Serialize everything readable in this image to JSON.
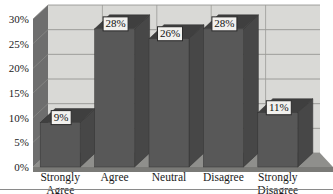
{
  "chart_data": {
    "type": "bar",
    "title": "",
    "subtitle": "",
    "xlabel": "",
    "ylabel": "",
    "categories": [
      "Strongly Agree",
      "Agree",
      "Neutral",
      "Disagree",
      "Strongly Disagree"
    ],
    "values": [
      9,
      28,
      26,
      28,
      11
    ],
    "value_labels": [
      "9%",
      "28%",
      "26%",
      "28%",
      "11%"
    ],
    "ylim": [
      0,
      30
    ],
    "ytick_values": [
      0,
      5,
      10,
      15,
      20,
      25,
      30
    ],
    "ytick_labels": [
      "0%",
      "5%",
      "10%",
      "15%",
      "20%",
      "25%",
      "30%"
    ],
    "grid": true,
    "grid_axis": "both",
    "legend": "none",
    "three_d": true,
    "series": [
      {
        "name": "Response share",
        "values": [
          9,
          28,
          26,
          28,
          11
        ]
      }
    ],
    "annotations": []
  },
  "category_lines": [
    [
      "Strongly",
      "Agree"
    ],
    [
      "Agree",
      ""
    ],
    [
      "Neutral",
      ""
    ],
    [
      "Disagree",
      ""
    ],
    [
      "Strongly",
      "Disagree"
    ]
  ],
  "colors": {
    "bar_front": "#585858",
    "bar_top": "#3f3f3f",
    "bar_side": "#474747",
    "back_wall": "#d9d9d6",
    "left_wall": "#6e6e6e",
    "floor": "#8f8f8c",
    "floor_front": "#7a7a77",
    "grid": "#8d8d8a",
    "label_box_fill": "#f2f1ee",
    "label_box_stroke": "#2a2a2a",
    "text": "#1a1a1a",
    "background": "#ffffff"
  }
}
